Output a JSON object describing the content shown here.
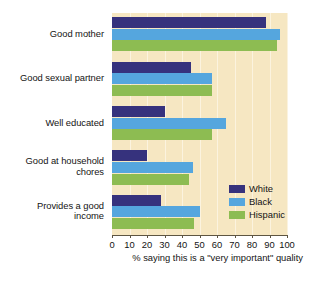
{
  "chart_data": {
    "type": "bar",
    "orientation": "horizontal",
    "title": "",
    "xlabel": "% saying this is a \"very important\" quality",
    "ylabel": "",
    "xlim": [
      0,
      100
    ],
    "xticks": [
      0,
      10,
      20,
      30,
      40,
      50,
      60,
      70,
      80,
      90,
      100
    ],
    "xtick_labels": [
      "0",
      "10",
      "20",
      "30",
      "40",
      "50",
      "60",
      "70",
      "80",
      "90",
      "100"
    ],
    "grid": true,
    "legend_position": "inside-lower-right",
    "categories": [
      "Good mother",
      "Good sexual partner",
      "Well educated",
      "Good at household chores",
      "Provides a good income"
    ],
    "series": [
      {
        "name": "White",
        "color": "#36327d",
        "values": [
          88,
          45,
          30,
          20,
          28
        ]
      },
      {
        "name": "Black",
        "color": "#55a6de",
        "values": [
          96,
          57,
          65,
          46,
          50
        ]
      },
      {
        "name": "Hispanic",
        "color": "#8dbc52",
        "values": [
          94,
          57,
          57,
          44,
          47
        ]
      }
    ],
    "plot_background": "#f6e7c2"
  },
  "axis": {
    "xlabel": "% saying this is a \"very important\" quality",
    "tick_labels": [
      "0",
      "10",
      "20",
      "30",
      "40",
      "50",
      "60",
      "70",
      "80",
      "90",
      "100"
    ]
  },
  "categories": [
    {
      "line1": "Good mother",
      "line2": ""
    },
    {
      "line1": "Good sexual partner",
      "line2": ""
    },
    {
      "line1": "Well educated",
      "line2": ""
    },
    {
      "line1": "Good at household",
      "line2": "chores"
    },
    {
      "line1": "Provides a good",
      "line2": "income"
    }
  ],
  "legend": {
    "items": [
      {
        "label": "White",
        "color": "#36327d"
      },
      {
        "label": "Black",
        "color": "#55a6de"
      },
      {
        "label": "Hispanic",
        "color": "#8dbc52"
      }
    ]
  },
  "footer": {
    "note": ""
  }
}
